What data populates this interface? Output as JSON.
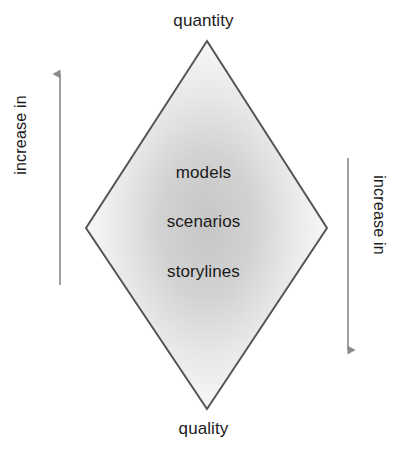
{
  "figure": {
    "type": "diagram",
    "shape": "diamond",
    "top_label": "quantity",
    "bottom_label": "quality",
    "inner_labels": [
      "models",
      "scenarios",
      "storylines"
    ],
    "left_axis": {
      "label": "increase in",
      "arrow_direction": "up"
    },
    "right_axis": {
      "label": "increase in",
      "arrow_direction": "down"
    },
    "caption": "",
    "colors": {
      "outline": "#555555",
      "fill_center": "#c8c8c8",
      "fill_edge": "#fdfdfd",
      "text": "#1c1c1c",
      "arrow": "#8a8a8a",
      "background": "#ffffff"
    }
  }
}
